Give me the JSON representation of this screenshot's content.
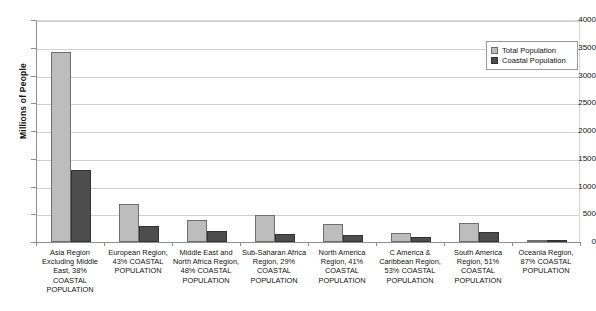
{
  "chart_data": {
    "type": "bar",
    "title": "",
    "xlabel": "",
    "ylabel": "Millions of People",
    "ylim": [
      0,
      4000
    ],
    "ytick_step": 500,
    "yticks": [
      "0",
      "500",
      "1000",
      "1500",
      "2000",
      "2500",
      "3000",
      "3500",
      "4000"
    ],
    "grid": true,
    "legend_position": "top-right",
    "categories": [
      "Asia Region Excluding Middle East, 38% COASTAL POPULATION",
      "European Region,  43% COASTAL POPULATION",
      "Middle East and North Africa Region, 48% COASTAL POPULATION",
      "Sub-Saharan Africa Region, 29% COASTAL POPULATION",
      "North America Region, 41% COASTAL POPULATION",
      "C America & Caribbean Region,  53% COASTAL POPULATION",
      "South America Region, 51% COASTAL POPULATION",
      "Oceania Region, 87% COASTAL POPULATION"
    ],
    "series": [
      {
        "name": "Total Population",
        "color": "#bdbdbd",
        "values": [
          3420,
          680,
          390,
          480,
          330,
          170,
          350,
          30
        ]
      },
      {
        "name": "Coastal Population",
        "color": "#4d4d4d",
        "values": [
          1295,
          290,
          190,
          140,
          135,
          90,
          180,
          25
        ]
      }
    ]
  },
  "legend": {
    "items": [
      {
        "label": "Total Population"
      },
      {
        "label": "Coastal Population"
      }
    ]
  },
  "axis": {
    "y_title": "Millions of People"
  }
}
